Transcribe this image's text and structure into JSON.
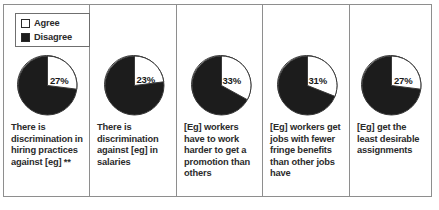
{
  "legend": {
    "items": [
      {
        "label": "Agree",
        "color": "#ffffff"
      },
      {
        "label": "Disagree",
        "color": "#1c1c1c"
      }
    ]
  },
  "chart_data": {
    "type": "pie",
    "title": "",
    "legend_position": "top-left",
    "series_names": [
      "Agree",
      "Disagree"
    ],
    "colors": {
      "Agree": "#ffffff",
      "Disagree": "#1c1c1c"
    },
    "panels": [
      {
        "label": "There is discrimination in hiring practices against [eg] **",
        "value_label": "27%",
        "agree": 27,
        "disagree": 73
      },
      {
        "label": "There is discrimination against [eg] in salaries",
        "value_label": "23%",
        "agree": 23,
        "disagree": 77
      },
      {
        "label": "[Eg] workers have to work harder to get a promotion than others",
        "value_label": "33%",
        "agree": 33,
        "disagree": 67
      },
      {
        "label": "[Eg] workers get jobs with fewer fringe benefits than other jobs have",
        "value_label": "31%",
        "agree": 31,
        "disagree": 69
      },
      {
        "label": "[Eg] get the least desirable assignments",
        "value_label": "27%",
        "agree": 27,
        "disagree": 73
      }
    ]
  }
}
